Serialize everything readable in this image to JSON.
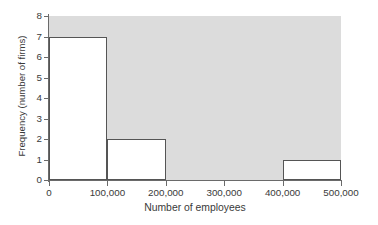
{
  "chart_data": {
    "type": "bar",
    "title": "",
    "subtitle": "",
    "xlabel": "Number of employees",
    "ylabel": "Frequency (number of firms)",
    "xlim": [
      0,
      500000
    ],
    "ylim": [
      0,
      8
    ],
    "grid": false,
    "legend": null,
    "plot_background_color": "#dcdcdc",
    "bar_fill_color": "#ffffff",
    "bar_edge_color": "#555555",
    "axis_color": "#6a6a6a",
    "bin_width": 100000,
    "categories": [
      "0-100,000",
      "100,000-200,000",
      "200,000-300,000",
      "300,000-400,000",
      "400,000-500,000"
    ],
    "values": [
      7,
      2,
      0,
      0,
      1
    ],
    "bins": [
      {
        "label": "0-100,000",
        "start": 0,
        "end": 100000,
        "value": 7
      },
      {
        "label": "100,000-200,000",
        "start": 100000,
        "end": 200000,
        "value": 2
      },
      {
        "label": "200,000-300,000",
        "start": 200000,
        "end": 300000,
        "value": 0
      },
      {
        "label": "300,000-400,000",
        "start": 300000,
        "end": 400000,
        "value": 0
      },
      {
        "label": "400,000-500,000",
        "start": 400000,
        "end": 500000,
        "value": 1
      }
    ],
    "xticks": [
      {
        "value": 0,
        "label": "0"
      },
      {
        "value": 100000,
        "label": "100,000"
      },
      {
        "value": 200000,
        "label": "200,000"
      },
      {
        "value": 300000,
        "label": "300,000"
      },
      {
        "value": 400000,
        "label": "400,000"
      },
      {
        "value": 500000,
        "label": "500,000"
      }
    ],
    "yticks": [
      {
        "value": 0,
        "label": "0"
      },
      {
        "value": 1,
        "label": "1"
      },
      {
        "value": 2,
        "label": "2"
      },
      {
        "value": 3,
        "label": "3"
      },
      {
        "value": 4,
        "label": "4"
      },
      {
        "value": 5,
        "label": "5"
      },
      {
        "value": 6,
        "label": "6"
      },
      {
        "value": 7,
        "label": "7"
      },
      {
        "value": 8,
        "label": "8"
      }
    ]
  }
}
